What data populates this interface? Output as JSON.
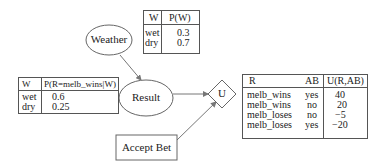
{
  "nodes": {
    "weather": {
      "label": "Weather",
      "shape": "ellipse"
    },
    "result": {
      "label": "Result",
      "shape": "ellipse"
    },
    "utility": {
      "label": "U",
      "shape": "diamond"
    },
    "accept_bet": {
      "label": "Accept Bet",
      "shape": "rectangle"
    }
  },
  "edges": [
    {
      "from": "Weather",
      "to": "Result"
    },
    {
      "from": "Result",
      "to": "U"
    },
    {
      "from": "Accept Bet",
      "to": "U"
    }
  ],
  "tables": {
    "p_weather": {
      "headers": [
        "W",
        "P(W)"
      ],
      "rows": [
        [
          "wet",
          "0.3"
        ],
        [
          "dry",
          "0.7"
        ]
      ]
    },
    "p_result": {
      "headers": [
        "W",
        "P(R=melb_wins|W)"
      ],
      "rows": [
        [
          "wet",
          "0.6"
        ],
        [
          "dry",
          "0.25"
        ]
      ]
    },
    "utility": {
      "headers": [
        "R",
        "AB",
        "U(R,AB)"
      ],
      "rows": [
        [
          "melb_wins",
          "yes",
          "40"
        ],
        [
          "melb_wins",
          "no",
          "20"
        ],
        [
          "melb_loses",
          "no",
          "−5"
        ],
        [
          "melb_loses",
          "yes",
          "−20"
        ]
      ]
    }
  }
}
